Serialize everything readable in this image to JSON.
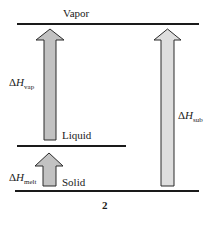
{
  "diagram": {
    "levels": {
      "vapor": "Vapor",
      "liquid": "Liquid",
      "solid": "Solid"
    },
    "arrows": {
      "vap": {
        "delta": "Δ",
        "symbol": "H",
        "subscript": "vap"
      },
      "melt": {
        "delta": "Δ",
        "symbol": "H",
        "subscript": "melt"
      },
      "sub": {
        "delta": "Δ",
        "symbol": "H",
        "subscript": "sub"
      }
    },
    "caption": "2",
    "colors": {
      "line": "#1a1a1a",
      "arrow_dark": "#c2c2c2",
      "arrow_light": "#dedede",
      "arrow_stroke": "#2a2a2a"
    }
  }
}
